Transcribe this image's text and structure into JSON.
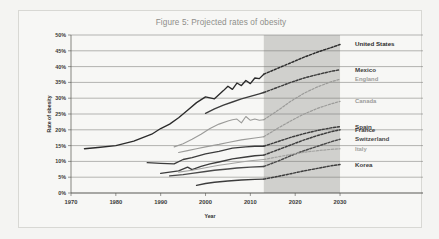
{
  "figure": {
    "title": "Figure 5: Projected rates of obesity",
    "title_color": "#8e8e8a",
    "background": "#f7f7f5",
    "projection_shade_color": "#c9c9c6"
  },
  "axes": {
    "xlabel": "Year",
    "ylabel": "Rate of obesity",
    "xticks": [
      "1970",
      "1980",
      "1990",
      "2000",
      "2010",
      "2020",
      "2030"
    ],
    "yticks": [
      "0%",
      "5%",
      "10%",
      "15%",
      "20%",
      "25%",
      "30%",
      "35%",
      "40%",
      "45%",
      "50%"
    ]
  },
  "chart_data": {
    "type": "line",
    "title": "Figure 5: Projected rates of obesity",
    "xlabel": "Year",
    "ylabel": "Rate of obesity",
    "xlim": [
      1970,
      2032
    ],
    "ylim": [
      0,
      50
    ],
    "ytick_values": [
      0,
      5,
      10,
      15,
      20,
      25,
      30,
      35,
      40,
      45,
      50
    ],
    "xtick_values": [
      1970,
      1980,
      1990,
      2000,
      2010,
      2020,
      2030
    ],
    "grid": "horizontal",
    "legend": "right-edge-inline-labels",
    "projection_start_year": 2013,
    "projection_end_year": 2030,
    "note": "Solid segments are observed data; dashed segments are projections within the shaded band.",
    "series": [
      {
        "name": "United States",
        "color": "#2b2b2b",
        "weight": "bold",
        "label_value": 47,
        "observed": [
          [
            1973,
            14.0
          ],
          [
            1976,
            14.4
          ],
          [
            1980,
            15.0
          ],
          [
            1984,
            16.4
          ],
          [
            1988,
            18.6
          ],
          [
            1990,
            20.4
          ],
          [
            1992,
            21.8
          ],
          [
            1994,
            23.8
          ],
          [
            1996,
            26.2
          ],
          [
            1998,
            28.6
          ],
          [
            2000,
            30.4
          ],
          [
            2002,
            29.8
          ],
          [
            2004,
            32.4
          ],
          [
            2005,
            33.8
          ],
          [
            2006,
            32.8
          ],
          [
            2007,
            34.8
          ],
          [
            2008,
            34.0
          ],
          [
            2009,
            35.6
          ],
          [
            2010,
            34.6
          ],
          [
            2011,
            36.4
          ],
          [
            2012,
            36.2
          ],
          [
            2013,
            37.6
          ]
        ],
        "projected": [
          [
            2013,
            37.6
          ],
          [
            2016,
            39.4
          ],
          [
            2019,
            41.2
          ],
          [
            2022,
            43.0
          ],
          [
            2025,
            44.6
          ],
          [
            2028,
            46.0
          ],
          [
            2030,
            47.0
          ]
        ]
      },
      {
        "name": "Mexico",
        "color": "#3c3c3c",
        "weight": "bold",
        "label_value": 39,
        "observed": [
          [
            2000,
            25.2
          ],
          [
            2002,
            26.6
          ],
          [
            2004,
            27.8
          ],
          [
            2006,
            28.8
          ],
          [
            2008,
            29.8
          ],
          [
            2010,
            30.6
          ],
          [
            2012,
            31.4
          ],
          [
            2013,
            31.8
          ]
        ],
        "projected": [
          [
            2013,
            31.8
          ],
          [
            2016,
            33.4
          ],
          [
            2019,
            35.0
          ],
          [
            2022,
            36.4
          ],
          [
            2025,
            37.5
          ],
          [
            2028,
            38.5
          ],
          [
            2030,
            39.0
          ]
        ]
      },
      {
        "name": "England",
        "color": "#9b9b99",
        "weight": "normal",
        "label_value": 36,
        "observed": [
          [
            1993,
            14.6
          ],
          [
            1995,
            15.6
          ],
          [
            1997,
            17.0
          ],
          [
            1999,
            18.6
          ],
          [
            2001,
            20.4
          ],
          [
            2003,
            21.8
          ],
          [
            2005,
            22.8
          ],
          [
            2006,
            23.2
          ],
          [
            2007,
            23.4
          ],
          [
            2008,
            22.2
          ],
          [
            2009,
            24.2
          ],
          [
            2010,
            23.0
          ],
          [
            2011,
            23.4
          ],
          [
            2012,
            23.0
          ],
          [
            2013,
            23.2
          ]
        ],
        "projected": [
          [
            2013,
            23.2
          ],
          [
            2016,
            26.0
          ],
          [
            2019,
            29.0
          ],
          [
            2022,
            31.6
          ],
          [
            2025,
            33.6
          ],
          [
            2028,
            35.2
          ],
          [
            2030,
            36.0
          ]
        ]
      },
      {
        "name": "Canada",
        "color": "#9b9b99",
        "weight": "normal",
        "label_value": 29,
        "observed": [
          [
            1994,
            12.8
          ],
          [
            1996,
            13.4
          ],
          [
            1998,
            14.0
          ],
          [
            2000,
            14.6
          ],
          [
            2003,
            15.4
          ],
          [
            2005,
            16.0
          ],
          [
            2008,
            16.8
          ],
          [
            2011,
            17.4
          ],
          [
            2013,
            17.8
          ]
        ],
        "projected": [
          [
            2013,
            17.8
          ],
          [
            2016,
            20.4
          ],
          [
            2019,
            22.8
          ],
          [
            2022,
            25.0
          ],
          [
            2025,
            26.8
          ],
          [
            2028,
            28.2
          ],
          [
            2030,
            29.0
          ]
        ]
      },
      {
        "name": "Spain",
        "color": "#3c3c3c",
        "weight": "bold",
        "label_value": 21,
        "observed": [
          [
            1987,
            9.6
          ],
          [
            1990,
            9.4
          ],
          [
            1993,
            9.2
          ],
          [
            1995,
            10.6
          ],
          [
            1997,
            11.2
          ],
          [
            2000,
            12.4
          ],
          [
            2003,
            13.2
          ],
          [
            2006,
            14.2
          ],
          [
            2009,
            14.6
          ],
          [
            2011,
            14.8
          ],
          [
            2013,
            14.8
          ]
        ],
        "projected": [
          [
            2013,
            14.8
          ],
          [
            2016,
            16.2
          ],
          [
            2019,
            17.6
          ],
          [
            2022,
            18.8
          ],
          [
            2025,
            19.8
          ],
          [
            2028,
            20.6
          ],
          [
            2030,
            21.0
          ]
        ]
      },
      {
        "name": "France",
        "color": "#3c3c3c",
        "weight": "bold",
        "label_value": 20,
        "observed": [
          [
            1990,
            6.2
          ],
          [
            1992,
            6.6
          ],
          [
            1994,
            7.0
          ],
          [
            1996,
            8.2
          ],
          [
            1997,
            7.4
          ],
          [
            1999,
            8.4
          ],
          [
            2001,
            9.2
          ],
          [
            2003,
            9.8
          ],
          [
            2006,
            10.8
          ],
          [
            2009,
            11.4
          ],
          [
            2011,
            11.8
          ],
          [
            2013,
            12.0
          ]
        ],
        "projected": [
          [
            2013,
            12.0
          ],
          [
            2016,
            13.6
          ],
          [
            2019,
            15.2
          ],
          [
            2022,
            16.8
          ],
          [
            2025,
            18.2
          ],
          [
            2028,
            19.4
          ],
          [
            2030,
            20.0
          ]
        ]
      },
      {
        "name": "Switzerland",
        "color": "#4a4a4a",
        "weight": "bold",
        "label_value": 17,
        "observed": [
          [
            1992,
            5.4
          ],
          [
            1995,
            5.8
          ],
          [
            1997,
            6.2
          ],
          [
            2000,
            6.8
          ],
          [
            2002,
            7.2
          ],
          [
            2005,
            7.6
          ],
          [
            2007,
            7.9
          ],
          [
            2010,
            8.2
          ],
          [
            2013,
            8.4
          ]
        ],
        "projected": [
          [
            2013,
            8.4
          ],
          [
            2016,
            10.0
          ],
          [
            2019,
            11.8
          ],
          [
            2022,
            13.4
          ],
          [
            2025,
            14.8
          ],
          [
            2028,
            16.2
          ],
          [
            2030,
            17.0
          ]
        ]
      },
      {
        "name": "Italy",
        "color": "#a3a3a1",
        "weight": "normal",
        "label_value": 14,
        "observed": [
          [
            1994,
            6.6
          ],
          [
            1997,
            7.2
          ],
          [
            2000,
            8.0
          ],
          [
            2003,
            8.8
          ],
          [
            2005,
            9.2
          ],
          [
            2008,
            9.8
          ],
          [
            2010,
            10.2
          ],
          [
            2013,
            10.6
          ]
        ],
        "projected": [
          [
            2013,
            10.6
          ],
          [
            2016,
            11.4
          ],
          [
            2019,
            12.2
          ],
          [
            2022,
            12.9
          ],
          [
            2025,
            13.4
          ],
          [
            2028,
            13.8
          ],
          [
            2030,
            14.0
          ]
        ]
      },
      {
        "name": "Korea",
        "color": "#3c3c3c",
        "weight": "bold",
        "label_value": 9,
        "observed": [
          [
            1998,
            2.4
          ],
          [
            2000,
            3.0
          ],
          [
            2002,
            3.4
          ],
          [
            2005,
            3.8
          ],
          [
            2008,
            4.1
          ],
          [
            2011,
            4.3
          ],
          [
            2013,
            4.4
          ]
        ],
        "projected": [
          [
            2013,
            4.4
          ],
          [
            2016,
            5.2
          ],
          [
            2019,
            6.1
          ],
          [
            2022,
            7.0
          ],
          [
            2025,
            7.8
          ],
          [
            2028,
            8.6
          ],
          [
            2030,
            9.0
          ]
        ]
      }
    ]
  }
}
